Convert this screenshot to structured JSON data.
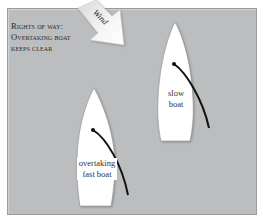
{
  "title": {
    "line1": "Rights of way:",
    "line2": "Overtaking boat",
    "line3": "keeps clear"
  },
  "wind": {
    "label": "Wind",
    "icon": "wind-arrow-icon"
  },
  "boats": [
    {
      "id": "slow",
      "label_line1": "slow",
      "label_line2": "boat"
    },
    {
      "id": "fast",
      "label_line1": "overtaking",
      "label_line2": "fast boat"
    }
  ],
  "colors": {
    "background": "#bcbdbf",
    "hull": "#ffffff",
    "boom": "#111111",
    "arrow": "#f4f4f4"
  }
}
